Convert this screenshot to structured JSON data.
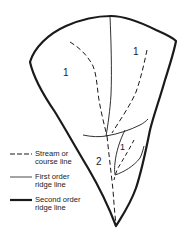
{
  "figure": {
    "type": "drainage basin stream order diagram",
    "colors": {
      "line": "#1a1a1a",
      "background": "#ffffff"
    },
    "labels": [
      {
        "text": "1",
        "region": "upper-left sub-basin"
      },
      {
        "text": "1",
        "region": "upper-right sub-basin"
      },
      {
        "text": "2",
        "region": "lower basin"
      },
      {
        "text": "1",
        "region": "lower-right small sub-basin"
      }
    ]
  },
  "legend": {
    "items": [
      {
        "symbol": "dashed",
        "label": "Stream or\ncourse line"
      },
      {
        "symbol": "thin",
        "label": "First order\nridge line"
      },
      {
        "symbol": "thick",
        "label": "Second order\nridge line"
      }
    ]
  }
}
